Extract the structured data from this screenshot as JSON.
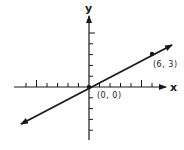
{
  "figure": {
    "type": "coordinate-plane-line",
    "x_axis_label": "x",
    "y_axis_label": "y",
    "origin_label": "(0, 0)",
    "point_label": "(6, 3)",
    "point": {
      "x": 6,
      "y": 3
    },
    "origin": {
      "x": 0,
      "y": 0
    },
    "x_ticks": [
      -6,
      -5,
      -4,
      -3,
      -2,
      -1,
      1,
      2,
      3,
      4,
      5,
      6
    ],
    "y_ticks": [
      -4,
      -3,
      -2,
      -1,
      1,
      2,
      3,
      4,
      5
    ],
    "major_ticks": [
      5,
      -5
    ],
    "line": {
      "slope": 0.5,
      "intercept": 0,
      "arrows": "both"
    },
    "colors": {
      "ink": "#1a1a1a",
      "background": "#ffffff"
    }
  }
}
